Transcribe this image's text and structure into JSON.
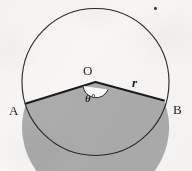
{
  "figure": {
    "background_color": "#f7f6f4",
    "ink_color": "#1b1b1b",
    "shaded_fill_color": "#ababab",
    "unshaded_fill_color": "#fbfaf8",
    "circle": {
      "center_x": 95.5,
      "center_y": 82,
      "radius": 73.5,
      "stroke_width": 1.1
    },
    "points": {
      "center": {
        "label": "O",
        "x": 95.5,
        "y": 82
      },
      "a": {
        "label": "A",
        "x": 26,
        "y": 103.5
      },
      "b": {
        "label": "B",
        "x": 164,
        "y": 100.5
      }
    },
    "labels": {
      "center": "O",
      "angle": "θ°",
      "radius": "r",
      "point_a": "A",
      "point_b": "B"
    },
    "angle_arc": {
      "radius": 13,
      "description": "reflex angle arc drawn at centre O inside the shaded sector"
    },
    "stray_mark": {
      "description": "small ink speck near top-right of scan",
      "x": 155,
      "y": 8
    }
  }
}
